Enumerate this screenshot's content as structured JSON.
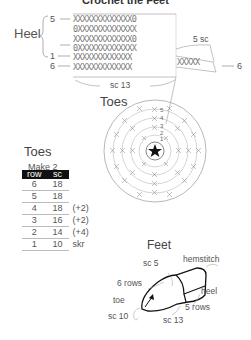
{
  "title": "Crochet the Feet",
  "heel": {
    "label": "Heel",
    "row_markers": [
      {
        "label": "5",
        "arrow": "←"
      },
      {
        "label": "",
        "arrow": "→"
      },
      {
        "label": "1",
        "arrow": "←"
      },
      {
        "label": "6",
        "arrow": "←"
      }
    ],
    "rows": [
      "XXXXXXXXXXXXX0",
      "0XXXXXXXXXXXXX",
      "XXXXXXXXXXXXX0",
      "0XXXXXXXXXXXXX",
      "XXXXXXXXXXXXX",
      "XXXXXXXXXXXXX"
    ],
    "extension_row": "XXXXX",
    "extension_label": "5 sc",
    "extension_row_num": "6",
    "bottom_label": "sc 13"
  },
  "toes_diagram": {
    "label": "Toes",
    "center_icon": "star-icon",
    "round_numbers": [
      "5",
      "4",
      "3",
      "2",
      "1"
    ]
  },
  "toes_table": {
    "title": "Toes",
    "subtitle": "Make 2",
    "columns": [
      "row",
      "sc"
    ],
    "rows": [
      {
        "row": "6",
        "sc": "18",
        "note": ""
      },
      {
        "row": "5",
        "sc": "18",
        "note": ""
      },
      {
        "row": "4",
        "sc": "18",
        "note": "(+2)"
      },
      {
        "row": "3",
        "sc": "16",
        "note": "(+2)"
      },
      {
        "row": "2",
        "sc": "14",
        "note": "(+4)"
      },
      {
        "row": "1",
        "sc": "10",
        "note": "skr"
      }
    ]
  },
  "feet": {
    "title": "Feet",
    "labels": {
      "sc5": "sc 5",
      "hemstitch": "hemstitch",
      "six_rows": "6 rows",
      "heel": "heel",
      "toe": "toe",
      "five_rows": "5 rows",
      "sc10": "sc 10",
      "sc13": "sc 13"
    }
  }
}
